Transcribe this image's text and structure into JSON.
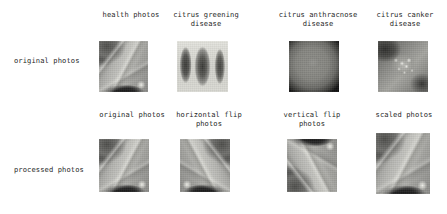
{
  "figure": {
    "rows": [
      {
        "row_label": "original photos",
        "cells": [
          {
            "caption": "health photos",
            "image": "healthy-citrus-leaf-photo"
          },
          {
            "caption": "citrus greening\ndisease",
            "image": "citrus-greening-leaves-photo"
          },
          {
            "caption": "citrus anthracnose\ndisease",
            "image": "citrus-anthracnose-fruit-photo"
          },
          {
            "caption": "citrus canker\ndisease",
            "image": "citrus-canker-lesion-photo"
          }
        ]
      },
      {
        "row_label": "processed photos",
        "cells": [
          {
            "caption": "original photos",
            "image": "processed-original-photo"
          },
          {
            "caption": "horizontal flip\nphotos",
            "image": "processed-horizontal-flip-photo"
          },
          {
            "caption": "vertical flip\nphotos",
            "image": "processed-vertical-flip-photo"
          },
          {
            "caption": "scaled photos",
            "image": "processed-scaled-photo"
          }
        ]
      }
    ]
  },
  "colors": {
    "background": "#ffffff",
    "text": "#1f1f1f"
  }
}
